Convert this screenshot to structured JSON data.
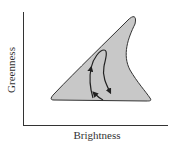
{
  "diagram": {
    "type": "tasseled-cap-triangle",
    "axes": {
      "x_label": "Brightness",
      "y_label": "Greenness"
    },
    "region": {
      "shape": "shark-fin triangle",
      "fill": "#c8c8c8",
      "stroke": "#333333"
    },
    "trajectory": {
      "description": "closed cyclic path with three arrowheads inside region",
      "arrow_count": 3,
      "stroke": "#222222"
    },
    "colors": {
      "background": "#ffffff",
      "axis": "#333333",
      "text": "#333333"
    }
  }
}
